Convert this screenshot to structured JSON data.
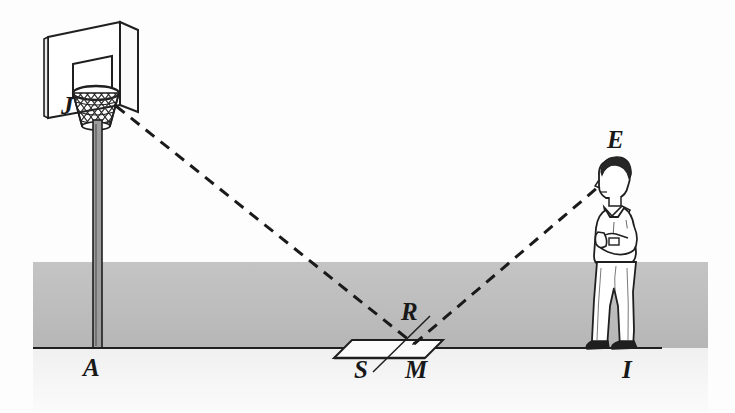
{
  "figure": {
    "background_color": "#fdfdfd",
    "ground_band_color": "#bcbcbc",
    "ink_color": "#1a1a1a",
    "caption": ""
  },
  "labels": {
    "hoop": "J",
    "pole_base": "A",
    "eye": "E",
    "incidence_point": "R",
    "mirror_near_edge": "S",
    "mirror_far_edge": "M",
    "person_feet": "I"
  },
  "objects": {
    "backboard": "basketball-backboard",
    "net": "basketball-net",
    "pole": "hoop-support-pole",
    "mirror": "plane-mirror-on-ground",
    "person": "standing-observer",
    "ground_line": "ground-baseline",
    "ray_hoop_to_mirror": "incident-ray-J-to-R",
    "ray_mirror_to_eye": "reflected-ray-R-to-E",
    "normal_line": "mirror-normal-through-R"
  },
  "ghost_text": {
    "line1": "",
    "line2": "",
    "line3": ""
  }
}
